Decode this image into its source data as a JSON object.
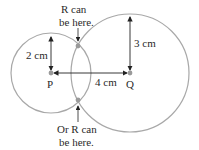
{
  "diagram": {
    "points": {
      "P": {
        "label": "P"
      },
      "Q": {
        "label": "Q"
      }
    },
    "measurements": {
      "radius_p": "2 cm",
      "radius_q": "3 cm",
      "distance_pq": "4 cm"
    },
    "annotations": {
      "top_line1": "R can",
      "top_line2": "be here.",
      "bottom_line1": "Or R can",
      "bottom_line2": "be here."
    },
    "colors": {
      "circle": "#a8a8a8",
      "point": "#9a9a9a",
      "arrow": "#222222",
      "text": "#2a2a2a"
    }
  }
}
